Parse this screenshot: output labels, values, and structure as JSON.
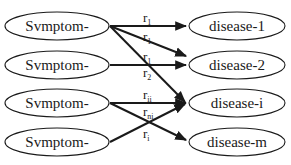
{
  "diagram": {
    "type": "bipartite-graph",
    "symptoms": [
      {
        "id": "s1",
        "label": "Svmptom-"
      },
      {
        "id": "s2",
        "label": "Svmptom-"
      },
      {
        "id": "s3",
        "label": "Svmptom-"
      },
      {
        "id": "s4",
        "label": "Svmptom-"
      }
    ],
    "diseases": [
      {
        "id": "d1",
        "label": "disease-1"
      },
      {
        "id": "d2",
        "label": "disease-2"
      },
      {
        "id": "di",
        "label": "disease-i"
      },
      {
        "id": "dm",
        "label": "disease-m"
      }
    ],
    "edges": [
      {
        "from": "s1",
        "to": "d1",
        "label_base": "r",
        "label_sub": "1"
      },
      {
        "from": "s1",
        "to": "d2",
        "label_base": "r",
        "label_sub": "1"
      },
      {
        "from": "s2",
        "to": "d2",
        "label_base": "r",
        "label_sub": "1"
      },
      {
        "from": "s1",
        "to": "di",
        "label_base": "r",
        "label_sub": "2"
      },
      {
        "from": "s3",
        "to": "di",
        "label_base": "r",
        "label_sub": "ii"
      },
      {
        "from": "s4",
        "to": "di",
        "label_base": "r",
        "label_sub": "ni"
      },
      {
        "from": "s3",
        "to": "dm",
        "label_base": "r",
        "label_sub": "i"
      }
    ],
    "colors": {
      "stroke": "#1a1a1a",
      "background": "#ffffff"
    }
  }
}
